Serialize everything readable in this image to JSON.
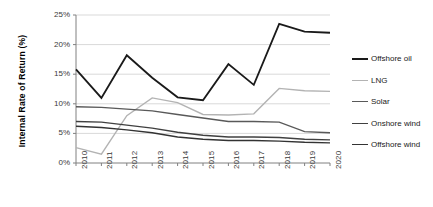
{
  "chart_data": {
    "type": "line",
    "title": "",
    "xlabel": "",
    "ylabel": "Internal Rate of Return (%)",
    "x": [
      2010,
      2011,
      2012,
      2013,
      2014,
      2015,
      2016,
      2017,
      2018,
      2019,
      2020
    ],
    "categories": [
      "2010",
      "2011",
      "2012",
      "2013",
      "2014",
      "2015",
      "2016",
      "2017",
      "2018",
      "2019",
      "2020"
    ],
    "ylim": [
      0,
      25
    ],
    "yticks": [
      0,
      5,
      10,
      15,
      20,
      25
    ],
    "ytick_labels": [
      "0%",
      "5%",
      "10%",
      "15%",
      "20%",
      "25%"
    ],
    "grid": true,
    "grid_axis": "y",
    "legend_position": "right",
    "series": [
      {
        "name": "Offshore oil",
        "color": "#1a1a1a",
        "width": 1.8,
        "values": [
          15.8,
          11.0,
          18.2,
          14.4,
          11.1,
          10.6,
          16.7,
          13.2,
          23.5,
          22.2,
          22.0
        ]
      },
      {
        "name": "LNG",
        "color": "#b3b3b3",
        "width": 1.4,
        "values": [
          2.6,
          1.5,
          8.0,
          11.0,
          10.2,
          8.2,
          8.1,
          8.3,
          12.6,
          12.2,
          12.1
        ]
      },
      {
        "name": "Solar",
        "color": "#595959",
        "width": 1.4,
        "values": [
          9.5,
          9.4,
          9.1,
          8.8,
          8.2,
          7.6,
          7.0,
          7.0,
          6.9,
          5.3,
          5.1
        ]
      },
      {
        "name": "Onshore wind",
        "color": "#404040",
        "width": 1.4,
        "values": [
          7.0,
          6.9,
          6.4,
          5.9,
          5.2,
          4.7,
          4.4,
          4.4,
          4.3,
          4.0,
          3.9
        ]
      },
      {
        "name": "Offshore wind",
        "color": "#333333",
        "width": 1.4,
        "values": [
          6.2,
          6.0,
          5.6,
          5.1,
          4.4,
          4.0,
          3.8,
          3.8,
          3.7,
          3.5,
          3.4
        ]
      }
    ]
  },
  "legend": {
    "items": [
      {
        "label": "Offshore oil"
      },
      {
        "label": "LNG"
      },
      {
        "label": "Solar"
      },
      {
        "label": "Onshore wind"
      },
      {
        "label": "Offshore wind"
      }
    ]
  },
  "style": {
    "grid_color": "#d9d9d9",
    "axis_color": "#808080",
    "text_color": "#3a3a3a"
  }
}
